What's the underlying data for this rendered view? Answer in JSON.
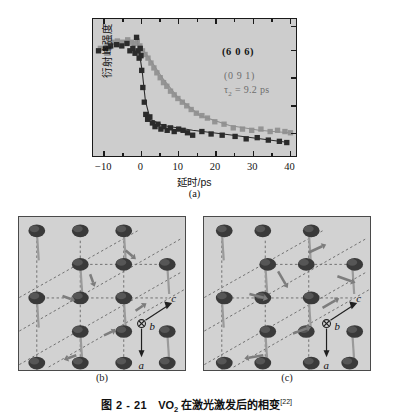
{
  "top_clipped_text": "·  ···  ·· ··· ·  ····  ··· ·· ··· ··  ·· ···",
  "panel_a": {
    "label": "(a)",
    "xlabel": "延时/ps",
    "ylabel": "衍射峰强度",
    "annotations": {
      "peak_dark": "(6 0 6)",
      "peak_gray": "(0 9 1)",
      "tau_symbol": "τ",
      "tau_subscript": "2",
      "tau_value": "= 9.2 ps"
    }
  },
  "panel_b": {
    "label": "(b)",
    "axes": {
      "a": "a",
      "b": "b",
      "c": "c"
    }
  },
  "panel_c": {
    "label": "(c)",
    "axes": {
      "a": "a",
      "b": "b",
      "c": "c"
    }
  },
  "caption": {
    "figure_number": "图 2 - 21",
    "material": "VO",
    "material_sub": "2",
    "text": " 在激光激发后的相变",
    "reference": "[22]"
  },
  "colors": {
    "plot_background": "#cdcdcd",
    "axis": "#1a1a1a",
    "series_dark": "#2b2b2b",
    "series_gray": "#8f8f8f",
    "structure_background": "#d2d2d2",
    "atom": "#3a3a3a",
    "bond": "#9a9a9a",
    "dashed_cell": "#707070",
    "arrow": "#7d7d7d"
  },
  "chart_data": {
    "type": "scatter",
    "title": "",
    "xlabel": "延时/ps",
    "ylabel": "衍射峰强度",
    "xlim": [
      -13,
      42
    ],
    "ylim": [
      0,
      1.12
    ],
    "xticks": [
      -10,
      0,
      10,
      20,
      30,
      40
    ],
    "xticklabels": [
      "−10",
      "0",
      "10",
      "20",
      "30",
      "40"
    ],
    "yticks": [],
    "grid": false,
    "legend": "none",
    "annotations": [
      {
        "text": "(6 0 6)",
        "x": 24,
        "y": 0.88,
        "color": "#151515"
      },
      {
        "text": "(0 9 1)",
        "x": 24,
        "y": 0.7,
        "color": "#6e6e6e"
      },
      {
        "text": "τ2 = 9.2 ps",
        "x": 24,
        "y": 0.6,
        "color": "#6e6e6e"
      }
    ],
    "series": [
      {
        "name": "(6 0 6)",
        "color": "#2b2b2b",
        "marker": "square",
        "x": [
          -11.5,
          -9.6,
          -8.2,
          -6.6,
          -5.2,
          -3.8,
          -3.0,
          -2.2,
          -1.6,
          -1.2,
          -0.8,
          -0.5,
          -0.2,
          0.0,
          0.2,
          0.5,
          0.9,
          1.3,
          1.8,
          2.4,
          3.1,
          3.8,
          4.6,
          5.4,
          6.2,
          7.1,
          8.0,
          9.0,
          10.2,
          11.4,
          12.6,
          14.0,
          16.5,
          19.0,
          22.0,
          25.5,
          28.5,
          31.5,
          34.5,
          37.5,
          39.5
        ],
        "y": [
          0.86,
          0.88,
          0.9,
          0.91,
          0.9,
          0.92,
          0.86,
          0.88,
          0.84,
          0.97,
          0.86,
          0.8,
          0.88,
          0.82,
          0.7,
          0.56,
          0.44,
          0.34,
          0.3,
          0.32,
          0.27,
          0.24,
          0.26,
          0.22,
          0.24,
          0.21,
          0.23,
          0.2,
          0.22,
          0.21,
          0.19,
          0.17,
          0.2,
          0.18,
          0.17,
          0.16,
          0.14,
          0.15,
          0.13,
          0.12,
          0.11
        ]
      },
      {
        "name": "(0 9 1)",
        "color": "#8f8f8f",
        "marker": "square",
        "x": [
          -11.0,
          -9.2,
          -7.8,
          -6.4,
          -5.0,
          -3.6,
          -2.6,
          -1.8,
          -1.0,
          -0.3,
          0.4,
          1.1,
          1.9,
          2.7,
          3.5,
          4.3,
          5.2,
          6.1,
          7.0,
          8.0,
          9.0,
          10.0,
          11.2,
          12.4,
          13.6,
          15.0,
          16.5,
          18.0,
          20.0,
          22.5,
          25.0,
          27.5,
          30.0,
          32.5,
          35.0,
          37.0,
          39.0,
          40.5
        ],
        "y": [
          0.88,
          0.91,
          0.93,
          0.94,
          0.93,
          0.95,
          0.93,
          0.92,
          0.94,
          0.9,
          0.86,
          0.83,
          0.8,
          0.76,
          0.72,
          0.68,
          0.64,
          0.6,
          0.57,
          0.53,
          0.5,
          0.47,
          0.44,
          0.41,
          0.38,
          0.35,
          0.33,
          0.31,
          0.28,
          0.26,
          0.23,
          0.22,
          0.21,
          0.22,
          0.2,
          0.21,
          0.2,
          0.19
        ]
      }
    ],
    "fit_lines": [
      {
        "name": "(6 0 6) fit",
        "color": "#2b2b2b",
        "points": [
          [
            -1.0,
            0.95
          ],
          [
            0.3,
            0.7
          ],
          [
            1.2,
            0.45
          ],
          [
            2.5,
            0.3
          ],
          [
            6,
            0.25
          ],
          [
            14,
            0.21
          ],
          [
            25,
            0.17
          ],
          [
            40,
            0.11
          ]
        ]
      },
      {
        "name": "(0 9 1) fit",
        "color": "#8f8f8f",
        "points": [
          [
            -1.0,
            0.93
          ],
          [
            2,
            0.81
          ],
          [
            6,
            0.63
          ],
          [
            10,
            0.48
          ],
          [
            16,
            0.33
          ],
          [
            24,
            0.25
          ],
          [
            32,
            0.21
          ],
          [
            40,
            0.19
          ]
        ]
      }
    ]
  },
  "structure_data": {
    "description": "VO2 lattice projections before (b) and after (c) laser excitation",
    "atom_rows": 5,
    "atom_cols": 4
  }
}
